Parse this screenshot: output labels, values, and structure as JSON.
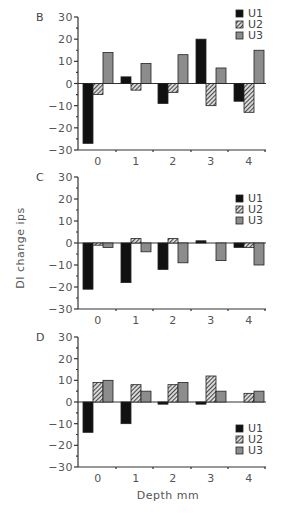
{
  "chart_data": [
    {
      "type": "bar",
      "panel": "B",
      "categories": [
        "0",
        "1",
        "2",
        "3",
        "4"
      ],
      "series": [
        {
          "name": "U1",
          "values": [
            -27,
            3,
            -9,
            20,
            -8
          ]
        },
        {
          "name": "U2",
          "values": [
            -5,
            -3,
            -4,
            -10,
            -13
          ]
        },
        {
          "name": "U3",
          "values": [
            14,
            9,
            13,
            7,
            15
          ]
        }
      ],
      "ylim": [
        -30,
        30
      ],
      "yticks": [
        30,
        20,
        10,
        0,
        -10,
        -20,
        -30
      ],
      "legend_position": "top-right",
      "grid": false
    },
    {
      "type": "bar",
      "panel": "C",
      "categories": [
        "0",
        "1",
        "2",
        "3",
        "4"
      ],
      "series": [
        {
          "name": "U1",
          "values": [
            -21,
            -18,
            -12,
            1,
            -2
          ]
        },
        {
          "name": "U2",
          "values": [
            -1,
            2,
            2,
            0,
            -2
          ]
        },
        {
          "name": "U3",
          "values": [
            -2,
            -4,
            -9,
            -8,
            -10
          ]
        }
      ],
      "ylim": [
        -30,
        30
      ],
      "yticks": [
        30,
        20,
        10,
        0,
        -10,
        -20,
        -30
      ],
      "ylabel": "DI change ips",
      "legend_position": "upper-right",
      "grid": false
    },
    {
      "type": "bar",
      "panel": "D",
      "categories": [
        "0",
        "1",
        "2",
        "3",
        "4"
      ],
      "series": [
        {
          "name": "U1",
          "values": [
            -14,
            -10,
            -1,
            -1,
            0
          ]
        },
        {
          "name": "U2",
          "values": [
            9,
            8,
            8,
            12,
            4
          ]
        },
        {
          "name": "U3",
          "values": [
            10,
            5,
            9,
            5,
            5
          ]
        }
      ],
      "ylim": [
        -30,
        30
      ],
      "yticks": [
        30,
        20,
        10,
        0,
        -10,
        -20,
        -30
      ],
      "xlabel": "Depth mm",
      "legend_position": "lower-right",
      "grid": false
    }
  ],
  "figure": {
    "ylabel": "DI change ips",
    "xlabel": "Depth mm",
    "series_styles": {
      "U1": {
        "fill": "#111111",
        "pattern": "solid-black"
      },
      "U2": {
        "fill": "#555555",
        "pattern": "diagonal-hatch"
      },
      "U3": {
        "fill": "#8a8a8a",
        "pattern": "solid-gray"
      }
    }
  }
}
